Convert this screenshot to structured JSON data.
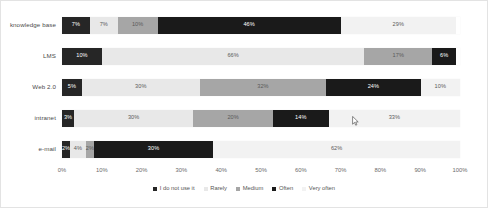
{
  "chart_data": {
    "type": "bar",
    "orientation": "horizontal",
    "stacked": true,
    "normalized": true,
    "title": "",
    "xlabel": "",
    "ylabel": "",
    "xlim": [
      0,
      100
    ],
    "grid": false,
    "legend_position": "bottom",
    "categories": [
      "knowledge base",
      "LMS",
      "Web 2.0",
      "intranet",
      "e-mail"
    ],
    "series": [
      {
        "name": "I do not use it",
        "color": "#262626",
        "values": [
          7,
          10,
          5,
          3,
          2
        ]
      },
      {
        "name": "Rarely",
        "color": "#e8e8e8",
        "values": [
          7,
          66,
          30,
          30,
          4
        ]
      },
      {
        "name": "Medium",
        "color": "#a6a6a6",
        "values": [
          10,
          17,
          32,
          20,
          2
        ]
      },
      {
        "name": "Often",
        "color": "#1a1a1a",
        "values": [
          46,
          6,
          24,
          14,
          30
        ]
      },
      {
        "name": "Very often",
        "color": "#f2f2f2",
        "values": [
          29,
          0,
          10,
          33,
          62
        ]
      }
    ],
    "tick_labels": [
      "0%",
      "10%",
      "20%",
      "30%",
      "40%",
      "50%",
      "60%",
      "70%",
      "80%",
      "90%",
      "100%"
    ],
    "tick_values": [
      0,
      10,
      20,
      30,
      40,
      50,
      60,
      70,
      80,
      90,
      100
    ],
    "data_labels": [
      [
        "7%",
        "7%",
        "10%",
        "46%",
        "29%"
      ],
      [
        "10%",
        "66%",
        "17%",
        "6%",
        ""
      ],
      [
        "5%",
        "30%",
        "32%",
        "24%",
        "10%"
      ],
      [
        "3%",
        "30%",
        "20%",
        "14%",
        "33%"
      ],
      [
        "2%",
        "4%",
        "2%",
        "30%",
        "62%"
      ]
    ]
  },
  "legend": {
    "items": [
      {
        "label": "I do not use it",
        "color": "#262626"
      },
      {
        "label": "Rarely",
        "color": "#e8e8e8"
      },
      {
        "label": "Medium",
        "color": "#a6a6a6"
      },
      {
        "label": "Often",
        "color": "#1a1a1a"
      },
      {
        "label": "Very often",
        "color": "#f2f2f2"
      }
    ]
  }
}
